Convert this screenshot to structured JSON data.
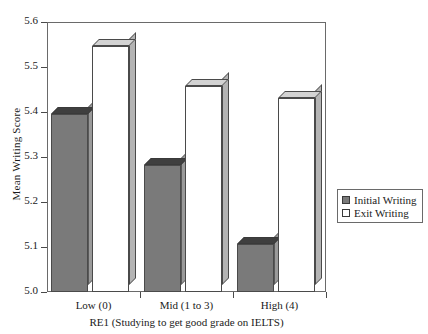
{
  "chart_data": {
    "type": "bar",
    "title": "",
    "subtitle": "",
    "xlabel": "RE1 (Studying to get good grade on IELTS)",
    "ylabel": "Mean Writing Score",
    "categories": [
      "Low (0)",
      "Mid (1 to 3)",
      "High (4)"
    ],
    "series": [
      {
        "name": "Initial Writing",
        "values": [
          5.395,
          5.283,
          5.107
        ],
        "color": "#7a7a7a"
      },
      {
        "name": "Exit Writing",
        "values": [
          5.547,
          5.458,
          5.432
        ],
        "color": "#ffffff"
      }
    ],
    "ylim": [
      5.0,
      5.6
    ],
    "yticks": [
      "5.0",
      "5.1",
      "5.2",
      "5.3",
      "5.4",
      "5.5",
      "5.6"
    ],
    "ytick_values": [
      5.0,
      5.1,
      5.2,
      5.3,
      5.4,
      5.5,
      5.6
    ],
    "grid": false,
    "legend_position": "right",
    "legend": [
      "Initial Writing",
      "Exit Writing"
    ],
    "frame": true,
    "style": "3d-bars"
  },
  "axes": {
    "y_title": "Mean Writing Score",
    "x_title": "RE1 (Studying to get good grade on IELTS)"
  },
  "legend": {
    "entries": [
      {
        "label": "Initial Writing",
        "swatch": "filled-gray-square"
      },
      {
        "label": "Exit Writing",
        "swatch": "empty-white-square"
      }
    ]
  }
}
